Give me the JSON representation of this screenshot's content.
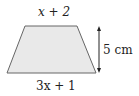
{
  "diagram": {
    "shape": "trapezoid",
    "top_side_label": "x + 2",
    "bottom_side_label": "3x + 1",
    "height_label": "5 cm",
    "fill_color": "#e9e9e9",
    "stroke_color": "#666666"
  }
}
